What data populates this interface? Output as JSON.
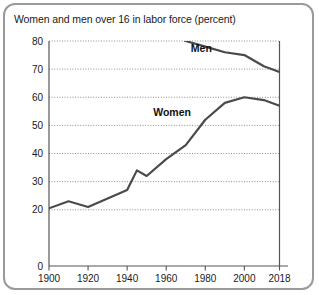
{
  "chart_data": {
    "type": "line",
    "title": "Women and men over 16 in labor force (percent)",
    "xlabel": "",
    "ylabel": "",
    "xlim": [
      1900,
      2018
    ],
    "ylim": [
      0,
      80
    ],
    "grid": true,
    "legend": "inline-labels",
    "y_ticks": [
      "0",
      "20",
      "30",
      "40",
      "50",
      "60",
      "70",
      "80"
    ],
    "y_tick_values": [
      0,
      20,
      30,
      40,
      50,
      60,
      70,
      80
    ],
    "x_ticks": [
      "1900",
      "1920",
      "1940",
      "1960",
      "1980",
      "2000",
      "2018"
    ],
    "x_tick_values": [
      1900,
      1920,
      1940,
      1960,
      1980,
      2000,
      2018
    ],
    "series": [
      {
        "name": "Men",
        "label": "Men",
        "label_x": 1978,
        "label_y": 77.5,
        "color": "#4a4a4a",
        "x": [
          1900,
          1910,
          1920,
          1930,
          1940,
          1950,
          1960,
          1970,
          1980,
          1990,
          2000,
          2010,
          2018
        ],
        "values": [
          86,
          86,
          85,
          84,
          83,
          86,
          84,
          80,
          78,
          76,
          75,
          71,
          69
        ]
      },
      {
        "name": "Women",
        "label": "Women",
        "label_x": 1963,
        "label_y": 54.5,
        "color": "#4a4a4a",
        "x": [
          1900,
          1910,
          1920,
          1930,
          1940,
          1945,
          1950,
          1960,
          1970,
          1980,
          1990,
          2000,
          2010,
          2018
        ],
        "values": [
          20.5,
          23,
          21,
          24,
          27,
          34,
          32,
          38,
          43,
          52,
          58,
          60,
          59,
          57
        ]
      }
    ],
    "annotations": []
  }
}
